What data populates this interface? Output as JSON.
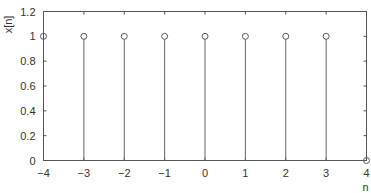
{
  "chart_data": {
    "type": "stem",
    "title": "",
    "xlabel": "n",
    "ylabel": "x[n]",
    "xlim": [
      -4,
      4
    ],
    "ylim": [
      0,
      1.2
    ],
    "x_ticks": [
      "−4",
      "−3",
      "−2",
      "−1",
      "0",
      "1",
      "2",
      "3",
      "4"
    ],
    "x_tick_values": [
      -4,
      -3,
      -2,
      -1,
      0,
      1,
      2,
      3,
      4
    ],
    "y_ticks": [
      "0",
      "0.2",
      "0.4",
      "0.6",
      "0.8",
      "1",
      "1.2"
    ],
    "y_tick_values": [
      0,
      0.2,
      0.4,
      0.6,
      0.8,
      1,
      1.2
    ],
    "x": [
      -4,
      -3,
      -2,
      -1,
      0,
      1,
      2,
      3,
      4
    ],
    "values": [
      1,
      1,
      1,
      1,
      1,
      1,
      1,
      1,
      0
    ],
    "grid": false,
    "legend": null,
    "marker": "open-circle"
  },
  "style": {
    "axis_color": "#555555",
    "stem_color": "#666666",
    "marker_color": "#555555",
    "background": "#ffffff"
  }
}
